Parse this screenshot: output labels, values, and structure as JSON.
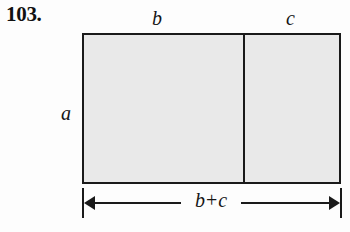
{
  "figure": {
    "problem_number": "103.",
    "background_color": "#fdfdfd",
    "rectangle": {
      "fill_color": "#e9e9e9",
      "stroke_color": "#1a1a1a",
      "has_vertical_divider": true
    },
    "labels": {
      "height_label": "a",
      "left_segment_label": "b",
      "right_segment_label": "c"
    },
    "dimension": {
      "term_left": "b",
      "operator": "+",
      "term_right": "c",
      "full_text": "b + c",
      "arrow_style": "double-headed"
    }
  }
}
